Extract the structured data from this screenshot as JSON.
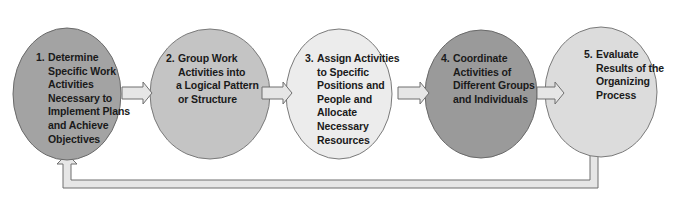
{
  "diagram": {
    "type": "process-cycle",
    "steps": [
      {
        "number": "1.",
        "lines": [
          "Determine",
          "Specific Work",
          "Activities",
          "Necessary to",
          "Implement Plans",
          "and Achieve",
          "Objectives"
        ],
        "fill": "#a3a3a3"
      },
      {
        "number": "2.",
        "lines": [
          "Group Work",
          "Activities into",
          "a Logical Pattern",
          "or Structure"
        ],
        "fill": "#c4c4c4"
      },
      {
        "number": "3.",
        "lines": [
          "Assign Activities",
          "to Specific",
          "Positions and",
          "People and",
          "Allocate",
          "Necessary",
          "Resources"
        ],
        "fill": "#ececec"
      },
      {
        "number": "4.",
        "lines": [
          "Coordinate",
          "Activities of",
          "Different Groups",
          "and Individuals"
        ],
        "fill": "#9a9a9a"
      },
      {
        "number": "5.",
        "lines": [
          "Evaluate",
          "Results of the",
          "Organizing",
          "Process"
        ],
        "fill": "#dcdcdc"
      }
    ],
    "arrow_fill": "#e6e6e6",
    "arrow_stroke": "#6f6f6f",
    "feedback_arrow": "from step 5 back to step 1"
  }
}
